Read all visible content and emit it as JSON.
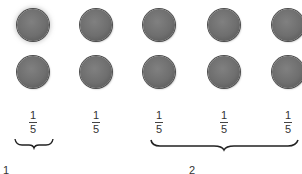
{
  "diagram": {
    "rows": 2,
    "columns": 5,
    "dot_color": "#6e6e6e",
    "fractions": [
      {
        "numerator": "1",
        "denominator": "5"
      },
      {
        "numerator": "1",
        "denominator": "5"
      },
      {
        "numerator": "1",
        "denominator": "5"
      },
      {
        "numerator": "1",
        "denominator": "5"
      },
      {
        "numerator": "1",
        "denominator": "5"
      }
    ],
    "groups": [
      {
        "label": "1",
        "spans_columns": [
          1
        ]
      },
      {
        "label": "2",
        "spans_columns": [
          3,
          4,
          5
        ]
      }
    ]
  }
}
